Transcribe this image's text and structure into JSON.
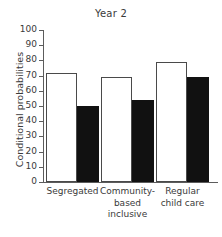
{
  "chart_data": {
    "type": "bar",
    "title": "Year 2",
    "xlabel": "",
    "ylabel": "Conditional probabilities",
    "ylim": [
      0,
      100
    ],
    "ytick_step": 10,
    "grid": false,
    "legend": "none",
    "categories": [
      "Segregated",
      "Community-based inclusive",
      "Regular child care"
    ],
    "category_lines": [
      [
        "Segregated"
      ],
      [
        "Community-",
        "based",
        "inclusive"
      ],
      [
        "Regular",
        "child care"
      ]
    ],
    "series": [
      {
        "name": "open-bar",
        "style": "white-outline",
        "values": [
          72,
          69,
          79
        ]
      },
      {
        "name": "filled-bar",
        "style": "black-solid",
        "values": [
          50,
          54,
          69
        ]
      }
    ],
    "ytick_labels": [
      "0",
      "10",
      "20",
      "30",
      "40",
      "50",
      "60",
      "70",
      "80",
      "90",
      "100"
    ],
    "colors": {
      "open_fill": "#ffffff",
      "open_stroke": "#4a4a4a",
      "filled_fill": "#111111",
      "axis": "#5c5c5c",
      "text": "#3a3a3a",
      "background": "#ffffff"
    }
  }
}
